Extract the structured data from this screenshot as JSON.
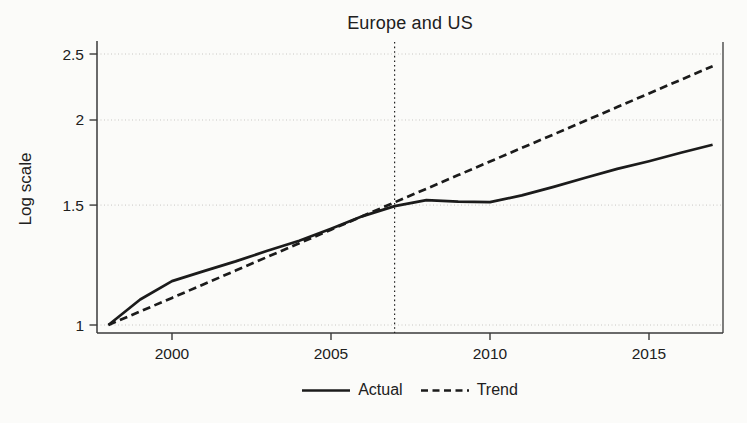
{
  "chart_data": {
    "type": "line",
    "title": "Europe and US",
    "xlabel": "",
    "ylabel": "Log scale",
    "yscale": "log",
    "grid": true,
    "legend_position": "bottom-center",
    "x": [
      1998,
      1999,
      2000,
      2001,
      2002,
      2003,
      2004,
      2005,
      2006,
      2007,
      2008,
      2009,
      2010,
      2011,
      2012,
      2013,
      2014,
      2015,
      2016,
      2017
    ],
    "series": [
      {
        "name": "Actual",
        "style": "solid",
        "values": [
          1.0,
          1.09,
          1.16,
          1.2,
          1.24,
          1.285,
          1.33,
          1.385,
          1.445,
          1.495,
          1.525,
          1.518,
          1.515,
          1.55,
          1.595,
          1.645,
          1.695,
          1.74,
          1.79,
          1.84
        ]
      },
      {
        "name": "Trend",
        "style": "dashed",
        "values": [
          1.0,
          1.047,
          1.096,
          1.148,
          1.202,
          1.259,
          1.318,
          1.38,
          1.445,
          1.514,
          1.585,
          1.66,
          1.738,
          1.82,
          1.905,
          1.995,
          2.089,
          2.188,
          2.291,
          2.399
        ]
      }
    ],
    "x_ticks": [
      2000,
      2005,
      2010,
      2015
    ],
    "y_ticks": [
      1,
      1.5,
      2,
      2.5
    ],
    "xlim": [
      1997.6,
      2017.35
    ],
    "ylim": [
      1.0,
      2.6
    ],
    "reference_line_x": 2007,
    "colors": {
      "line": "#1b1b1b",
      "grid": "#c8c7c4",
      "axis": "#3a3a3a",
      "text": "#202020",
      "background": "#fbfbf9"
    }
  }
}
